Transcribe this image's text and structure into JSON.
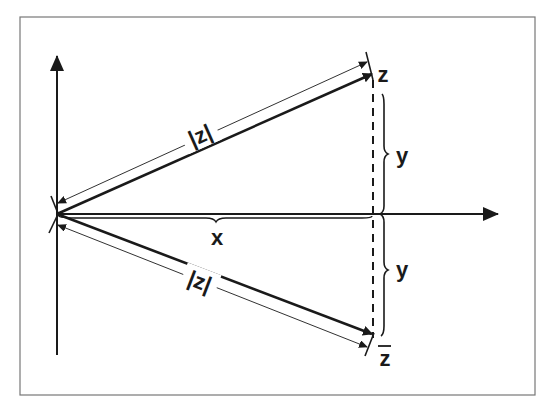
{
  "diagram": {
    "type": "complex-plane-conjugate",
    "frame_color": "#777777",
    "stroke_color": "#1a1a1a",
    "axes": {
      "horizontal": {
        "direction": "right",
        "arrow": true
      },
      "vertical": {
        "direction": "up",
        "arrow": true
      }
    },
    "points": [
      {
        "id": "z",
        "label": "z",
        "position": "upper-right"
      },
      {
        "id": "z_conjugate",
        "label": "z",
        "overline": true,
        "position": "lower-right"
      }
    ],
    "labels": {
      "modulus_upper": "|z|",
      "modulus_lower": "|z|",
      "real_part": "x",
      "imag_upper": "y",
      "imag_lower": "y",
      "point_z": "z",
      "point_zbar": "z"
    },
    "vectors": [
      {
        "from": "origin",
        "to": "z",
        "style": "thick-arrow"
      },
      {
        "from": "origin",
        "to": "z_conjugate",
        "style": "thick-arrow"
      }
    ],
    "dimensions": [
      {
        "label": "|z|",
        "along": "origin-to-z",
        "style": "double-arrow-thin"
      },
      {
        "label": "|z|",
        "along": "origin-to-z_conjugate",
        "style": "double-arrow-thin"
      },
      {
        "label": "x",
        "along": "real-axis",
        "style": "brace"
      },
      {
        "label": "y",
        "along": "vertical-upper",
        "style": "brace"
      },
      {
        "label": "y",
        "along": "vertical-lower",
        "style": "brace"
      }
    ],
    "guides": [
      {
        "from": "z",
        "to": "z_conjugate",
        "style": "dashed"
      }
    ]
  }
}
